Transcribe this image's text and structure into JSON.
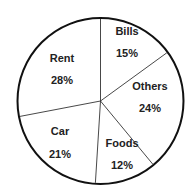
{
  "chart_data": {
    "type": "pie",
    "title": "",
    "categories": [
      "Bills",
      "Others",
      "Foods",
      "Car",
      "Rent"
    ],
    "values": [
      15,
      24,
      12,
      21,
      28
    ],
    "value_labels": [
      "15%",
      "24%",
      "12%",
      "21%",
      "28%"
    ],
    "start_angle_deg": 0,
    "direction": "clockwise",
    "legend": "none",
    "fill": "#ffffff",
    "stroke": "#111111"
  },
  "labels": {
    "bills": {
      "name": "Bills",
      "pct": "15%"
    },
    "others": {
      "name": "Others",
      "pct": "24%"
    },
    "foods": {
      "name": "Foods",
      "pct": "12%"
    },
    "car": {
      "name": "Car",
      "pct": "21%"
    },
    "rent": {
      "name": "Rent",
      "pct": "28%"
    }
  }
}
